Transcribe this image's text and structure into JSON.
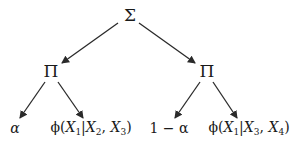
{
  "diagram": {
    "type": "expression-tree",
    "root": {
      "id": "sum",
      "label": "Σ",
      "x": 130,
      "y": 15
    },
    "products": [
      {
        "id": "prod-left",
        "label": "Π",
        "x": 51,
        "y": 71
      },
      {
        "id": "prod-right",
        "label": "Π",
        "x": 207,
        "y": 71
      }
    ],
    "leaves": [
      {
        "id": "leaf-alpha",
        "label": "α",
        "x": 15,
        "y": 128,
        "parent": "prod-left"
      },
      {
        "id": "leaf-phi-1",
        "label": "ϕ(X1|X2, X3)",
        "func": "ϕ(",
        "v1": "X",
        "s1": "1",
        "sep": "|",
        "v2": "X",
        "s2": "2",
        "comma": ", ",
        "v3": "X",
        "s3": "3",
        "close": ")",
        "x": 91,
        "y": 128,
        "parent": "prod-left"
      },
      {
        "id": "leaf-one-minus-alpha",
        "label": "1 − α",
        "x": 169,
        "y": 128,
        "parent": "prod-right"
      },
      {
        "id": "leaf-phi-2",
        "label": "ϕ(X1|X3, X4)",
        "func": "ϕ(",
        "v1": "X",
        "s1": "1",
        "sep": "|",
        "v2": "X",
        "s2": "3",
        "comma": ", ",
        "v3": "X",
        "s3": "4",
        "close": ")",
        "x": 249,
        "y": 128,
        "parent": "prod-right"
      }
    ],
    "edges": [
      {
        "from": "sum",
        "to": "prod-left"
      },
      {
        "from": "sum",
        "to": "prod-right"
      },
      {
        "from": "prod-left",
        "to": "leaf-alpha"
      },
      {
        "from": "prod-left",
        "to": "leaf-phi-1"
      },
      {
        "from": "prod-right",
        "to": "leaf-one-minus-alpha"
      },
      {
        "from": "prod-right",
        "to": "leaf-phi-2"
      }
    ],
    "colors": {
      "stroke": "#2a2a2a",
      "background": "#ffffff"
    }
  }
}
